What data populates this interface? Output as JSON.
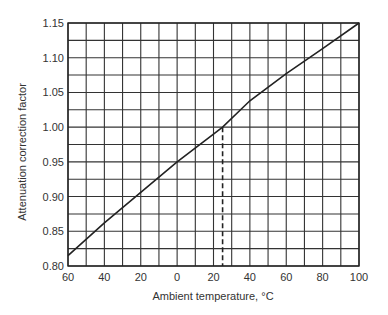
{
  "chart_data": {
    "type": "line",
    "title": "",
    "xlabel": "Ambient temperature, °C",
    "ylabel": "Attenuation correction factor",
    "xlim": [
      -60,
      100
    ],
    "ylim": [
      0.8,
      1.15
    ],
    "x_tick_labels": [
      "60",
      "40",
      "20",
      "0",
      "20",
      "40",
      "60",
      "80",
      "100"
    ],
    "x_tick_values": [
      -60,
      -40,
      -20,
      0,
      20,
      40,
      60,
      80,
      100
    ],
    "y_tick_labels": [
      "0.80",
      "0.85",
      "0.90",
      "0.95",
      "1.00",
      "1.05",
      "1.10",
      "1.15"
    ],
    "y_tick_values": [
      0.8,
      0.85,
      0.9,
      0.95,
      1.0,
      1.05,
      1.1,
      1.15
    ],
    "grid": true,
    "grid_x_step": 10,
    "grid_y_step": 0.025,
    "legend": "none",
    "series": [
      {
        "name": "Attenuation correction factor",
        "x": [
          -60,
          -40,
          -20,
          0,
          20,
          25,
          40,
          60,
          80,
          100
        ],
        "y": [
          0.815,
          0.862,
          0.906,
          0.95,
          0.99,
          1.0,
          1.038,
          1.077,
          1.113,
          1.15
        ]
      }
    ],
    "annotations": [
      {
        "type": "dashed-vline",
        "x": 25,
        "y_from": 0.8,
        "y_to": 1.0,
        "note": "reference at 1.00 correction factor"
      }
    ],
    "colors": {
      "line": "#222222",
      "grid": "#333333",
      "background": "#ffffff"
    }
  }
}
